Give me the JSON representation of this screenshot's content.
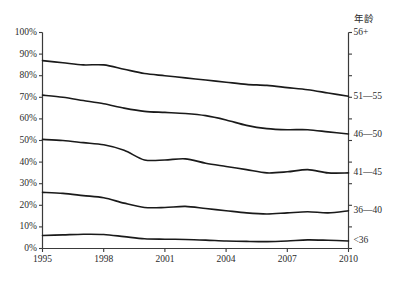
{
  "legend_title": "年龄",
  "caption": "",
  "axes": {
    "y_ticks": [
      "100%",
      "90%",
      "80%",
      "70%",
      "60%",
      "50%",
      "40%",
      "30%",
      "20%",
      "10%",
      "0%"
    ],
    "x_ticks": [
      "1995",
      "1998",
      "2001",
      "2004",
      "2007",
      "2010"
    ],
    "ylim": [
      0,
      100
    ],
    "xlim": [
      1995,
      2010
    ]
  },
  "series_end_labels": [
    "56+",
    "51—55",
    "46—50",
    "41—45",
    "36—40",
    "<36"
  ],
  "colors": {
    "line": "#1a1a1a",
    "axis": "#3a3a3a",
    "background": "#ffffff"
  },
  "chart_data": {
    "type": "line",
    "title": "",
    "xlabel": "",
    "ylabel": "",
    "xlim": [
      1995,
      2010
    ],
    "ylim": [
      0,
      100
    ],
    "grid": false,
    "legend_position": "right-axis-labels",
    "legend_title": "年龄",
    "x": [
      1995,
      1996,
      1997,
      1998,
      1999,
      2000,
      2001,
      2002,
      2003,
      2004,
      2005,
      2006,
      2007,
      2008,
      2009,
      2010
    ],
    "x_tick_labels": [
      "1995",
      "1998",
      "2001",
      "2004",
      "2007",
      "2010"
    ],
    "y_tick_labels": [
      "0%",
      "10%",
      "20%",
      "30%",
      "40%",
      "50%",
      "60%",
      "70%",
      "80%",
      "90%",
      "100%"
    ],
    "series": [
      {
        "name": "51—55",
        "end_label": "51—55",
        "values": [
          87,
          86,
          85,
          85,
          83,
          81,
          80,
          79,
          78,
          77,
          76,
          75.5,
          74.5,
          73.5,
          72,
          70.5
        ]
      },
      {
        "name": "46—50",
        "end_label": "46—50",
        "values": [
          71,
          70,
          68.5,
          67,
          65,
          63.5,
          63,
          62.5,
          61.5,
          59.5,
          57,
          55.5,
          55,
          55,
          54,
          53
        ]
      },
      {
        "name": "41—45",
        "end_label": "41—45",
        "values": [
          50.5,
          50,
          49,
          48,
          45.5,
          41,
          41,
          41.5,
          39.5,
          38,
          36.5,
          35,
          35.5,
          36.5,
          35,
          35
        ]
      },
      {
        "name": "36—40",
        "end_label": "36—40",
        "values": [
          26,
          25.5,
          24.5,
          23.5,
          21,
          19,
          19,
          19.5,
          18.5,
          17.5,
          16.5,
          16,
          16.5,
          17,
          16.5,
          17.5
        ]
      },
      {
        "name": "<36",
        "end_label": "<36",
        "values": [
          6,
          6.3,
          6.6,
          6.5,
          5.5,
          4.5,
          4.3,
          4.2,
          3.9,
          3.5,
          3.3,
          3.2,
          3.5,
          4,
          3.8,
          3.5
        ]
      }
    ],
    "series_top_label": "56+"
  }
}
